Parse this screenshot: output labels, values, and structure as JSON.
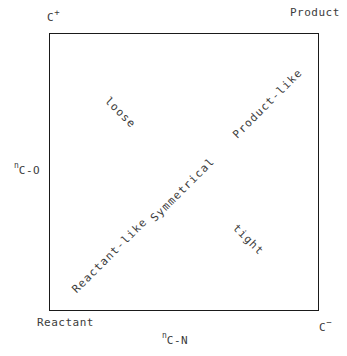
{
  "figure": {
    "type": "reaction-coordinate-diagram",
    "width": 347,
    "height": 356,
    "background_color": "#ffffff",
    "line_color": "#1a1a1a",
    "text_color": "#3c3c3c"
  },
  "corners": {
    "top_left": {
      "text": "C",
      "charge": "+"
    },
    "top_right": {
      "text": "Product"
    },
    "bottom_left": {
      "text": "Reactant"
    },
    "bottom_right": {
      "text": "C",
      "charge": "−"
    }
  },
  "axes": {
    "y": {
      "prefix": "n",
      "body": "C-O"
    },
    "x": {
      "prefix": "n",
      "body": "C-N"
    }
  },
  "interior_labels": {
    "loose": "loose",
    "product_like": "Product-like",
    "symmetrical": "Symmetrical",
    "reactant_like": "Reactant-like",
    "tight": "tight"
  },
  "chart_data": {
    "type": "scatter",
    "title": "",
    "xlabel": "n C-N",
    "ylabel": "n C-O",
    "grid": false,
    "legend": "none",
    "xlim": [
      0,
      1
    ],
    "ylim": [
      0,
      1
    ],
    "corner_labels": [
      {
        "position": "top-left",
        "label": "C+",
        "x": 0,
        "y": 1
      },
      {
        "position": "top-right",
        "label": "Product",
        "x": 1,
        "y": 1
      },
      {
        "position": "bottom-left",
        "label": "Reactant",
        "x": 0,
        "y": 0
      },
      {
        "position": "bottom-right",
        "label": "C-",
        "x": 1,
        "y": 0
      }
    ],
    "annotations": [
      {
        "label": "loose",
        "x": 0.26,
        "y": 0.71,
        "rotation_deg": 45,
        "region": "upper-left"
      },
      {
        "label": "Product-like",
        "x": 0.81,
        "y": 0.75,
        "rotation_deg": -45,
        "region": "diagonal-upper"
      },
      {
        "label": "Symmetrical",
        "x": 0.5,
        "y": 0.44,
        "rotation_deg": -45,
        "region": "diagonal-center"
      },
      {
        "label": "Reactant-like",
        "x": 0.23,
        "y": 0.2,
        "rotation_deg": -45,
        "region": "diagonal-lower"
      },
      {
        "label": "tight",
        "x": 0.74,
        "y": 0.26,
        "rotation_deg": 45,
        "region": "lower-right"
      }
    ]
  }
}
